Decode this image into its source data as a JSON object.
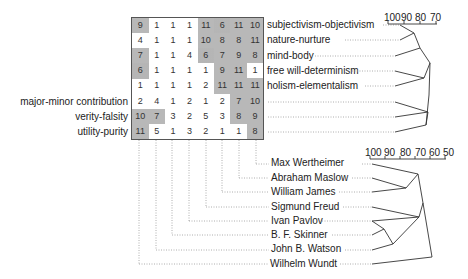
{
  "grid": {
    "values": [
      [
        9,
        1,
        1,
        1,
        11,
        6,
        11,
        10
      ],
      [
        4,
        1,
        1,
        1,
        10,
        8,
        8,
        11
      ],
      [
        7,
        1,
        1,
        4,
        6,
        7,
        9,
        8
      ],
      [
        6,
        1,
        1,
        1,
        1,
        9,
        11,
        1
      ],
      [
        1,
        1,
        1,
        1,
        2,
        11,
        11,
        11
      ],
      [
        2,
        4,
        1,
        2,
        1,
        2,
        7,
        10
      ],
      [
        10,
        7,
        3,
        2,
        5,
        3,
        8,
        9
      ],
      [
        11,
        5,
        1,
        3,
        2,
        1,
        1,
        8
      ]
    ],
    "shading": {
      "high_threshold": 7,
      "mid_value": 6,
      "high_color": "#b8b8b8"
    }
  },
  "constructs": {
    "right_labels": [
      "subjectivism-objectivism",
      "nature-nurture",
      "mind-body",
      "free will-determinism",
      "holism-elementalism"
    ],
    "left_labels": [
      "major-minor contribution",
      "verity-falsity",
      "utility-purity"
    ],
    "scale": [
      "100",
      "90",
      "80",
      "70"
    ]
  },
  "elements": {
    "labels": [
      "Max Wertheimer",
      "Abraham Maslow",
      "William James",
      "Sigmund Freud",
      "Ivan Pavlov",
      "B. F. Skinner",
      "John B. Watson",
      "Wilhelm Wundt"
    ],
    "scale": [
      "100",
      "90",
      "80",
      "70",
      "60",
      "50"
    ]
  }
}
